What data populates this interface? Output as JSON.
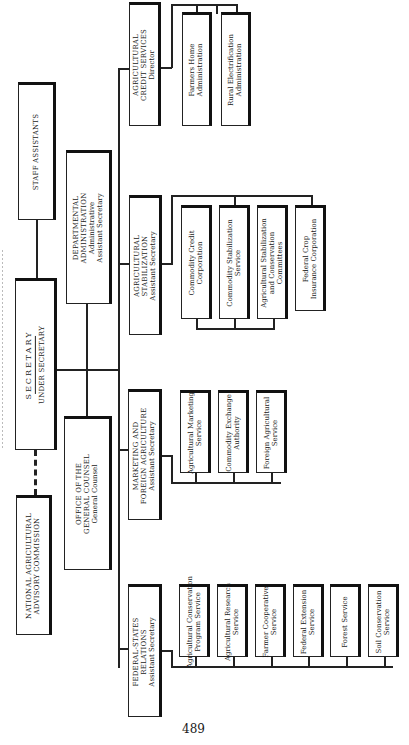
{
  "chart": {
    "secretary": {
      "title": "SECRETARY",
      "subtitle": "UNDER SECRETARY"
    },
    "staff_assistants": "STAFF ASSISTANTS",
    "advisory_commission": {
      "line1": "NATIONAL AGRICULTURAL",
      "line2": "ADVISORY COMMISSION"
    },
    "general_counsel": {
      "line1": "OFFICE OF THE",
      "line2": "GENERAL COUNSEL",
      "line3": "General Counsel"
    },
    "departmental_administration": {
      "line1": "DEPARTMENTAL",
      "line2": "ADMINISTRATION",
      "line3": "Administrative",
      "line4": "Assistant Secretary"
    },
    "divisions": [
      {
        "head": {
          "line1": "AGRICULTURAL",
          "line2": "CREDIT SERVICES",
          "line3": "Director"
        },
        "agencies": [
          {
            "line1": "Farmers Home",
            "line2": "Administration"
          },
          {
            "line1": "Rural Electrification",
            "line2": "Administration"
          }
        ]
      },
      {
        "head": {
          "line1": "AGRICULTURAL",
          "line2": "STABILIZATION",
          "line3": "Assistant Secretary"
        },
        "agencies": [
          {
            "line1": "Commodity Credit",
            "line2": "Corporation"
          },
          {
            "line1": "Commodity Stabilization",
            "line2": "Service"
          },
          {
            "line1": "Agricultural Stabilization",
            "line2": "and Conservation",
            "line3": "Committees"
          },
          {
            "line1": "Federal Crop",
            "line2": "Insurance Corporation"
          }
        ]
      },
      {
        "head": {
          "line1": "MARKETING AND",
          "line2": "FOREIGN AGRICULTURE",
          "line3": "Assistant Secretary"
        },
        "agencies": [
          {
            "line1": "Agricultural Marketing",
            "line2": "Service"
          },
          {
            "line1": "Commodity Exchange",
            "line2": "Authority"
          },
          {
            "line1": "Foreign Agricultural",
            "line2": "Service"
          }
        ]
      },
      {
        "head": {
          "line1": "FEDERAL-STATES",
          "line2": "RELATIONS",
          "line3": "Assistant Secretary"
        },
        "agencies": [
          {
            "line1": "Agricultural Conservation",
            "line2": "Program Service"
          },
          {
            "line1": "Agricultural Research",
            "line2": "Service"
          },
          {
            "line1": "Farmer Cooperative",
            "line2": "Service"
          },
          {
            "line1": "Federal Extension",
            "line2": "Service"
          },
          {
            "line1": "Forest Service",
            "line2": ""
          },
          {
            "line1": "Soil Conservation",
            "line2": "Service"
          }
        ]
      }
    ],
    "page_number": "489"
  }
}
